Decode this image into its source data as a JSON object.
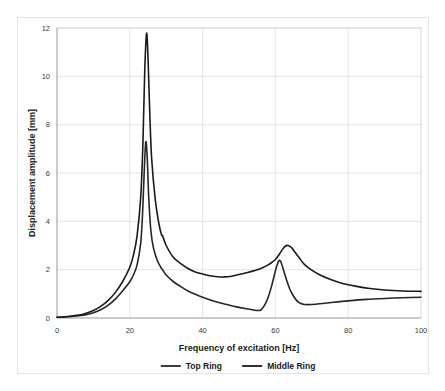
{
  "chart_data": {
    "type": "line",
    "title": "",
    "xlabel": "Frequency of excitation [Hz]",
    "ylabel": "Displacement amplitude [mm]",
    "xlim": [
      0,
      100
    ],
    "ylim": [
      0,
      12
    ],
    "xticks": [
      "0",
      "20",
      "40",
      "60",
      "80",
      "100"
    ],
    "xtick_values": [
      0,
      20,
      40,
      60,
      80,
      100
    ],
    "yticks": [
      "0",
      "2",
      "4",
      "6",
      "8",
      "10",
      "12"
    ],
    "ytick_values": [
      0,
      2,
      4,
      6,
      8,
      10,
      12
    ],
    "grid": true,
    "grid_axis": "both",
    "legend_position": "bottom",
    "series": [
      {
        "name": "Top Ring",
        "color": "#262626",
        "x": [
          0,
          2,
          4,
          6,
          8,
          10,
          12,
          14,
          16,
          18,
          20,
          21,
          22,
          23,
          23.5,
          24,
          24.4,
          24.8,
          25.2,
          25.8,
          26.5,
          27.5,
          28.5,
          29,
          30,
          32,
          34,
          36,
          38,
          40,
          43,
          46,
          49,
          52,
          54,
          55,
          56,
          57,
          58,
          59,
          60,
          60.5,
          61,
          61.5,
          62,
          63,
          64,
          65,
          66,
          67,
          68,
          70,
          73,
          76,
          80,
          85,
          90,
          95,
          100
        ],
        "y": [
          0.03,
          0.04,
          0.06,
          0.09,
          0.14,
          0.22,
          0.34,
          0.52,
          0.78,
          1.12,
          1.5,
          1.78,
          2.2,
          3.1,
          4.3,
          6.2,
          7.3,
          6.6,
          5.0,
          3.6,
          2.9,
          2.4,
          2.1,
          2.0,
          1.78,
          1.5,
          1.3,
          1.12,
          0.98,
          0.86,
          0.7,
          0.58,
          0.47,
          0.38,
          0.33,
          0.31,
          0.33,
          0.52,
          0.85,
          1.35,
          1.95,
          2.2,
          2.38,
          2.32,
          2.1,
          1.6,
          1.18,
          0.9,
          0.7,
          0.6,
          0.56,
          0.56,
          0.6,
          0.65,
          0.71,
          0.77,
          0.81,
          0.84,
          0.86
        ]
      },
      {
        "name": "Middle Ring",
        "color": "#1a1a1a",
        "x": [
          0,
          2,
          4,
          6,
          8,
          10,
          12,
          14,
          16,
          18,
          20,
          21,
          22,
          23,
          23.6,
          24.1,
          24.6,
          25,
          25.5,
          26,
          27,
          28,
          28.7,
          29,
          30,
          32,
          34,
          36,
          38,
          40,
          42,
          44,
          46,
          48,
          50,
          52,
          54,
          56,
          58,
          59,
          60,
          61,
          62,
          62.8,
          63.5,
          64.5,
          65.5,
          66.5,
          67.5,
          68.5,
          70,
          72,
          75,
          78,
          82,
          86,
          90,
          95,
          100
        ],
        "y": [
          0.03,
          0.05,
          0.08,
          0.12,
          0.2,
          0.31,
          0.48,
          0.72,
          1.05,
          1.5,
          2.1,
          2.6,
          3.4,
          5.0,
          7.2,
          10.2,
          11.78,
          10.8,
          8.4,
          6.6,
          4.9,
          3.9,
          3.45,
          3.4,
          3.0,
          2.5,
          2.25,
          2.05,
          1.9,
          1.82,
          1.75,
          1.71,
          1.7,
          1.73,
          1.8,
          1.87,
          1.95,
          2.05,
          2.2,
          2.3,
          2.42,
          2.62,
          2.85,
          2.98,
          3.0,
          2.9,
          2.7,
          2.5,
          2.3,
          2.15,
          1.98,
          1.8,
          1.6,
          1.45,
          1.32,
          1.22,
          1.16,
          1.12,
          1.1
        ]
      }
    ]
  },
  "legend": {
    "items": [
      {
        "label": "Top Ring"
      },
      {
        "label": "Middle Ring"
      }
    ]
  }
}
